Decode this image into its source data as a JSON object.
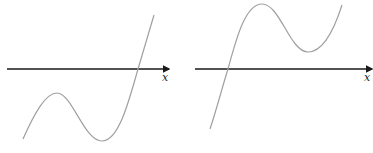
{
  "diagram": {
    "panels": [
      {
        "id": "left",
        "axis_label": "x",
        "description": "cubic curve with local max below axis, one root on right"
      },
      {
        "id": "right",
        "axis_label": "x",
        "description": "cubic curve with local min above axis, one root on left"
      }
    ],
    "colors": {
      "axis": "#1a1a1a",
      "curve": "#a0a0a0"
    }
  }
}
